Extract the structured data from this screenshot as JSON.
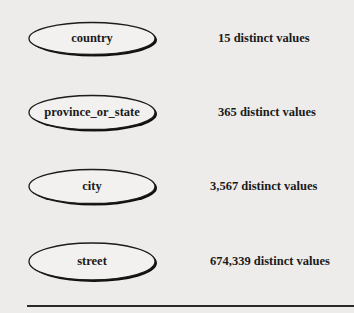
{
  "diagram": {
    "type": "concept-hierarchy",
    "nodes": [
      {
        "label": "country",
        "distinct_values": "15 distinct values"
      },
      {
        "label": "province_or_state",
        "distinct_values": "365 distinct values"
      },
      {
        "label": "city",
        "distinct_values": "3,567 distinct values"
      },
      {
        "label": "street",
        "distinct_values": "674,339 distinct values"
      }
    ],
    "edges": [
      {
        "from": "country",
        "to": "province_or_state"
      },
      {
        "from": "province_or_state",
        "to": "city"
      },
      {
        "from": "city",
        "to": "street"
      }
    ]
  },
  "colors": {
    "background": "#edecea",
    "ink": "#1a1a1a",
    "bleed_through": "#c9c7c4"
  }
}
